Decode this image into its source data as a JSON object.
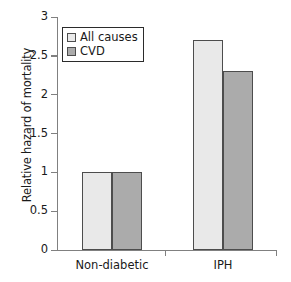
{
  "chart_data": {
    "type": "bar",
    "title": "",
    "subtitle": "",
    "xlabel": "",
    "ylabel": "Relative hazard of mortality",
    "categories": [
      "Non-diabetic",
      "IPH"
    ],
    "series": [
      {
        "name": "All causes",
        "values": [
          1.0,
          2.7
        ],
        "color": "#e9e9e9"
      },
      {
        "name": "CVD",
        "values": [
          1.0,
          2.3
        ],
        "color": "#ababab"
      }
    ],
    "ylim": [
      0,
      3
    ],
    "ytick_labels": [
      "0",
      "0.5",
      "1",
      "1.5",
      "2",
      "2.5",
      "3"
    ],
    "ytick_values": [
      0,
      0.5,
      1,
      1.5,
      2,
      2.5,
      3
    ],
    "grid": false,
    "legend_position": "top-left",
    "annotations": []
  },
  "legend": {
    "entries": [
      {
        "label": "All causes"
      },
      {
        "label": "CVD"
      }
    ]
  },
  "style": {
    "bar_border_color": "#4d4d4d",
    "axis_color": "#808080",
    "text_color": "#1a1a1a",
    "background": "#ffffff"
  }
}
